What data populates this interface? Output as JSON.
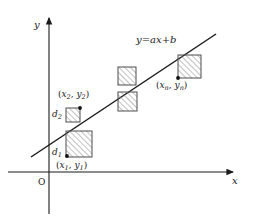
{
  "figure": {
    "type": "scatter-regression-diagram"
  },
  "axes": {
    "y_label": "y",
    "x_label": "x",
    "origin_label": "O",
    "x_axis": {
      "x1": 8,
      "y1": 172,
      "x2": 237,
      "y2": 172
    },
    "y_axis": {
      "x1": 49,
      "y1": 214,
      "x2": 49,
      "y2": 14
    }
  },
  "line": {
    "equation_parts": {
      "lhs": "y",
      "eq": "=",
      "a": "a",
      "x": "x",
      "plus": "+",
      "b": "b"
    },
    "equation_text": "y = ax + b",
    "x1": 31,
    "y1": 157,
    "x2": 216,
    "y2": 34,
    "color": "#1a1a1a"
  },
  "squares": [
    {
      "name": "square-1",
      "x": 66,
      "y": 131,
      "size": 26,
      "dot_x": 67,
      "dot_y": 156
    },
    {
      "name": "square-2",
      "x": 66,
      "y": 108,
      "size": 14,
      "dot_x": 80,
      "dot_y": 108
    },
    {
      "name": "square-3",
      "x": 118,
      "y": 92,
      "size": 19,
      "dot_x": 118,
      "dot_y": 92
    },
    {
      "name": "square-4",
      "x": 118,
      "y": 67,
      "size": 18,
      "dot_x": 136,
      "dot_y": 85
    },
    {
      "name": "square-n",
      "x": 178,
      "y": 55,
      "size": 23,
      "dot_x": 178,
      "dot_y": 78
    }
  ],
  "point_labels": [
    {
      "name": "point-label-1",
      "open": "(",
      "x_sym": "x",
      "x_sub": "1",
      "comma": ",",
      "y_sym": "y",
      "y_sub": "1",
      "close": ")"
    },
    {
      "name": "point-label-2",
      "open": "(",
      "x_sym": "x",
      "x_sub": "2",
      "comma": ",",
      "y_sym": "y",
      "y_sub": "2",
      "close": ")"
    },
    {
      "name": "point-label-n",
      "open": "(",
      "x_sym": "x",
      "x_sub": "n",
      "comma": ",",
      "y_sym": "y",
      "y_sub": "n",
      "close": ")"
    }
  ],
  "distance_labels": [
    {
      "name": "distance-label-1",
      "sym": "d",
      "sub": "1"
    },
    {
      "name": "distance-label-2",
      "sym": "d",
      "sub": "2"
    }
  ],
  "style": {
    "stroke": "#1a1a1a",
    "hatch_color": "#8a8a8a",
    "square_border": "#555555",
    "background": "#ffffff"
  }
}
